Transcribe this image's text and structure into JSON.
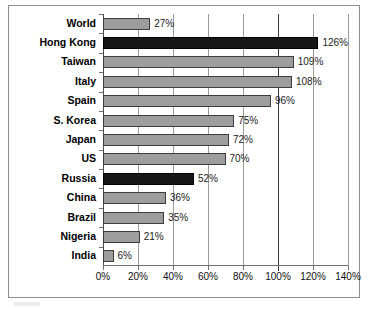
{
  "chart_data": {
    "type": "bar",
    "orientation": "horizontal",
    "title": "",
    "subtitle": "",
    "xlabel": "",
    "ylabel": "",
    "xlim": [
      0,
      140
    ],
    "xtick_labels": [
      "0%",
      "20%",
      "40%",
      "60%",
      "80%",
      "100%",
      "120%",
      "140%"
    ],
    "xticks": [
      0,
      20,
      40,
      60,
      80,
      100,
      120,
      140
    ],
    "grid": true,
    "legend": false,
    "value_suffix": "%",
    "categories": [
      "World",
      "Hong Kong",
      "Taiwan",
      "Italy",
      "Spain",
      "S. Korea",
      "Japan",
      "US",
      "Russia",
      "China",
      "Brazil",
      "Nigeria",
      "India"
    ],
    "values": [
      27,
      126,
      109,
      108,
      96,
      75,
      72,
      70,
      52,
      36,
      35,
      21,
      6
    ],
    "data_labels": [
      "27%",
      "126%",
      "109%",
      "108%",
      "96%",
      "75%",
      "72%",
      "70%",
      "52%",
      "36%",
      "35%",
      "21%",
      "6%"
    ],
    "highlighted": [
      false,
      true,
      false,
      false,
      false,
      false,
      false,
      false,
      true,
      false,
      false,
      false,
      false
    ],
    "colors": {
      "bar_fill": "#9d9d9d",
      "bar_highlight_fill": "#171717",
      "bar_border": "#3c3c3c",
      "gridline": "#9b9b9b",
      "axis": "#6f6f6f",
      "frame": "#8d8d8d",
      "text": "#000000",
      "background": "#ffffff"
    }
  }
}
